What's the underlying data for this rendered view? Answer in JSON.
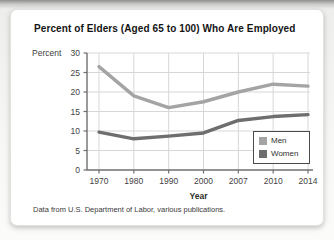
{
  "figure": {
    "title": "Percent of Elders (Aged 65 to 100) Who Are Employed",
    "footnote": "Data from U.S. Department of Labor, various publications."
  },
  "chart_data": {
    "type": "line",
    "title": "Percent of Elders (Aged 65 to 100) Who Are Employed",
    "categories": [
      "1970",
      "1980",
      "1990",
      "2000",
      "2007",
      "2010",
      "2014"
    ],
    "series": [
      {
        "name": "Men",
        "color": "#a4a4a4",
        "values": [
          26.5,
          19,
          16,
          17.5,
          20,
          22,
          21.5
        ]
      },
      {
        "name": "Women",
        "color": "#6e6e6e",
        "values": [
          9.7,
          8,
          8.7,
          9.5,
          12.7,
          13.7,
          14.2
        ]
      }
    ],
    "xlabel": "Year",
    "ylabel": "Percent",
    "ylim": [
      0,
      30
    ],
    "ytick_step": 5,
    "grid": true,
    "legend_position": "inside-bottom-right",
    "colors": {
      "grid": "#d7d7d5",
      "axis": "#6f6f6f",
      "tick_label": "#434343"
    }
  }
}
